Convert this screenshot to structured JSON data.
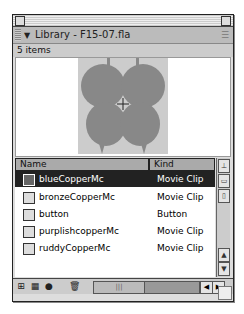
{
  "window": {
    "title": "Library - F15-07.fla",
    "item_count": "5 items",
    "menu_icon": "options-menu-icon"
  },
  "preview": {
    "symbol": "butterfly",
    "fill_color": "#888888",
    "bg_color": "#cccccc"
  },
  "columns": {
    "name": "Name",
    "kind": "Kind"
  },
  "items": [
    {
      "name": "blueCopperMc",
      "kind": "Movie Clip",
      "icon": "movie-clip-icon",
      "selected": true
    },
    {
      "name": "bronzeCopperMc",
      "kind": "Movie Clip",
      "icon": "movie-clip-icon",
      "selected": false
    },
    {
      "name": "button",
      "kind": "Button",
      "icon": "button-icon",
      "selected": false
    },
    {
      "name": "purplishcopperMc",
      "kind": "Movie Clip",
      "icon": "movie-clip-icon",
      "selected": false
    },
    {
      "name": "ruddyCopperMc",
      "kind": "Movie Clip",
      "icon": "movie-clip-icon",
      "selected": false
    }
  ],
  "glyphs": {
    "triangle": "▼",
    "menu": "☰",
    "sort": "⊥",
    "up": "▲",
    "down": "▼",
    "left": "◀",
    "right": "▶",
    "new_symbol": "⊞",
    "folder": "▦",
    "info": "●",
    "trash": "🗑",
    "thumb": "|||",
    "wide": "▭",
    "narrow": "▯"
  }
}
